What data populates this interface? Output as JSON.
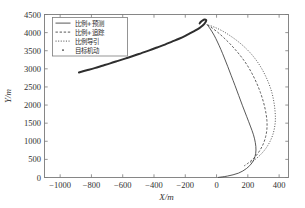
{
  "chart_data": {
    "type": "line",
    "title": "",
    "xlabel": "X/m",
    "ylabel": "Y/m",
    "xlim": [
      -1100,
      460
    ],
    "ylim": [
      0,
      4500
    ],
    "xticks": [
      -1000,
      -800,
      -600,
      -400,
      -200,
      0,
      200,
      400
    ],
    "xtick_labels": [
      "-1000",
      "-800",
      "-600",
      "-400",
      "-200",
      "0",
      "200",
      "400"
    ],
    "yticks": [
      0,
      500,
      1000,
      1500,
      2000,
      2500,
      3000,
      3500,
      4000,
      4500
    ],
    "ytick_labels": [
      "0",
      "500",
      "1000",
      "1500",
      "2000",
      "2500",
      "3000",
      "3500",
      "4000",
      "4500"
    ],
    "grid": false,
    "legend_position": "upper-left",
    "series": [
      {
        "name": "比例+预测",
        "style": "solid",
        "points": [
          [
            -62,
            4230
          ],
          [
            -40,
            4100
          ],
          [
            -16,
            3930
          ],
          [
            6,
            3740
          ],
          [
            28,
            3530
          ],
          [
            50,
            3300
          ],
          [
            72,
            3060
          ],
          [
            94,
            2810
          ],
          [
            118,
            2540
          ],
          [
            142,
            2260
          ],
          [
            166,
            1980
          ],
          [
            192,
            1690
          ],
          [
            216,
            1420
          ],
          [
            236,
            1180
          ],
          [
            248,
            960
          ],
          [
            252,
            760
          ],
          [
            246,
            580
          ],
          [
            228,
            410
          ],
          [
            192,
            250
          ],
          [
            140,
            120
          ],
          [
            70,
            40
          ],
          [
            10,
            2
          ]
        ]
      },
      {
        "name": "比例+追踪",
        "style": "dashed",
        "points": [
          [
            -58,
            4215
          ],
          [
            -26,
            4120
          ],
          [
            10,
            4000
          ],
          [
            46,
            3860
          ],
          [
            84,
            3700
          ],
          [
            122,
            3520
          ],
          [
            160,
            3320
          ],
          [
            196,
            3100
          ],
          [
            228,
            2860
          ],
          [
            256,
            2610
          ],
          [
            280,
            2350
          ],
          [
            300,
            2080
          ],
          [
            314,
            1820
          ],
          [
            322,
            1570
          ],
          [
            322,
            1340
          ],
          [
            314,
            1130
          ],
          [
            300,
            940
          ],
          [
            280,
            770
          ],
          [
            256,
            620
          ],
          [
            228,
            490
          ],
          [
            200,
            390
          ],
          [
            176,
            320
          ]
        ]
      },
      {
        "name": "比例导引",
        "style": "dotted",
        "points": [
          [
            -52,
            4210
          ],
          [
            -8,
            4140
          ],
          [
            40,
            4040
          ],
          [
            88,
            3910
          ],
          [
            136,
            3760
          ],
          [
            184,
            3580
          ],
          [
            228,
            3380
          ],
          [
            268,
            3150
          ],
          [
            302,
            2900
          ],
          [
            330,
            2640
          ],
          [
            352,
            2370
          ],
          [
            366,
            2100
          ],
          [
            374,
            1830
          ],
          [
            376,
            1580
          ],
          [
            370,
            1360
          ],
          [
            358,
            1160
          ],
          [
            340,
            980
          ],
          [
            318,
            820
          ],
          [
            292,
            680
          ],
          [
            264,
            560
          ],
          [
            238,
            470
          ],
          [
            216,
            410
          ]
        ]
      },
      {
        "name": "目标机动",
        "style": "target",
        "points": [
          [
            -880,
            2900
          ],
          [
            -830,
            2960
          ],
          [
            -780,
            3020
          ],
          [
            -730,
            3085
          ],
          [
            -680,
            3150
          ],
          [
            -630,
            3220
          ],
          [
            -580,
            3290
          ],
          [
            -530,
            3360
          ],
          [
            -480,
            3435
          ],
          [
            -430,
            3510
          ],
          [
            -380,
            3590
          ],
          [
            -330,
            3670
          ],
          [
            -285,
            3750
          ],
          [
            -240,
            3830
          ],
          [
            -200,
            3910
          ],
          [
            -165,
            3990
          ],
          [
            -135,
            4060
          ],
          [
            -110,
            4125
          ],
          [
            -92,
            4185
          ],
          [
            -78,
            4240
          ],
          [
            -70,
            4290
          ],
          [
            -66,
            4330
          ],
          [
            -68,
            4355
          ],
          [
            -76,
            4360
          ],
          [
            -88,
            4340
          ],
          [
            -100,
            4300
          ],
          [
            -108,
            4255
          ]
        ]
      }
    ],
    "legend_entries": [
      {
        "label": "比例+预测",
        "style": "solid"
      },
      {
        "label": "比例+追踪",
        "style": "dashed"
      },
      {
        "label": "比例导引",
        "style": "dotted"
      },
      {
        "label": "目标机动",
        "style": "marker"
      }
    ]
  }
}
